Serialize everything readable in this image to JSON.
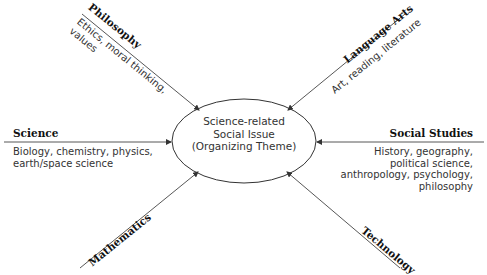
{
  "center": {
    "line1": "Science-related",
    "line2": "Social Issue",
    "line3": "(Organizing Theme)"
  },
  "nodes": {
    "philosophy": {
      "title": "Philosophy",
      "desc_line1": "Ethics, moral thinking,",
      "desc_line2": "values"
    },
    "language_arts": {
      "title": "Language Arts",
      "desc": "Art, reading, literature"
    },
    "science": {
      "title": "Science",
      "desc_line1": "Biology, chemistry, physics,",
      "desc_line2": "earth/space science"
    },
    "social_studies": {
      "title": "Social Studies",
      "desc_line1": "History, geography,",
      "desc_line2": "political science,",
      "desc_line3": "anthropology, psychology,",
      "desc_line4": "philosophy"
    },
    "mathematics": {
      "title": "Mathematics"
    },
    "technology": {
      "title": "Technology"
    }
  },
  "colors": {
    "line": "#333333",
    "text": "#2a2a2a"
  }
}
